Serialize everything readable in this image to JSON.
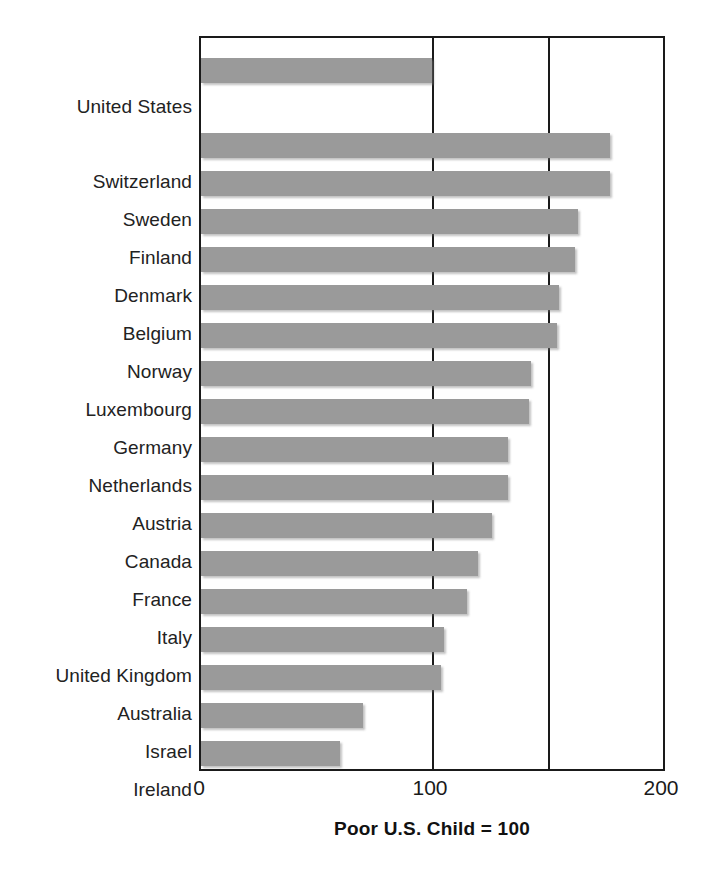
{
  "chart_data": {
    "type": "bar",
    "orientation": "horizontal",
    "title": "",
    "subtitle": "",
    "xlabel": "Poor U.S. Child = 100",
    "ylabel": "",
    "xlim": [
      0,
      200
    ],
    "xticks": [
      0,
      100,
      200
    ],
    "xtick_labels": [
      "0",
      "100",
      "200"
    ],
    "gridlines_x": [
      100,
      150
    ],
    "grid": true,
    "legend": null,
    "bar_color": "#9a9a9a",
    "axis_color": "#1a1a1a",
    "categories": [
      "United States",
      "Switzerland",
      "Sweden",
      "Finland",
      "Denmark",
      "Belgium",
      "Norway",
      "Luxembourg",
      "Germany",
      "Netherlands",
      "Austria",
      "Canada",
      "France",
      "Italy",
      "United Kingdom",
      "Australia",
      "Israel",
      "Ireland"
    ],
    "values": [
      100,
      177,
      177,
      163,
      162,
      155,
      154,
      143,
      142,
      133,
      133,
      126,
      120,
      115,
      105,
      104,
      70,
      60
    ]
  },
  "axis": {
    "tick_0": "0",
    "tick_100": "100",
    "tick_200": "200",
    "title": "Poor U.S. Child = 100"
  }
}
